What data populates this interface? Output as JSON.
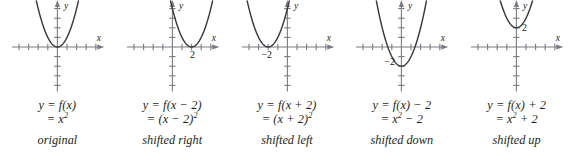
{
  "figure": {
    "axis_color": "#7b7b83",
    "curve_color": "#3a3a3e",
    "text_color": "#231f20",
    "background": "#ffffff"
  },
  "panels": [
    {
      "name": "original",
      "equation_line1": "y = f(x)",
      "equation_line2_prefix": "= x",
      "equation_line2_exp": "2",
      "equation_line2_suffix": "",
      "description": "original",
      "x_axis_label": "x",
      "y_axis_label": "y",
      "vertex_label": "",
      "vertex_x": 0,
      "vertex_y": 0,
      "ticks_left": 4,
      "ticks_right": 4,
      "ticks_up": 4,
      "ticks_down": 4
    },
    {
      "name": "shifted-right",
      "equation_line1": "y = f(x − 2)",
      "equation_line2_prefix": "= (x − 2)",
      "equation_line2_exp": "2",
      "equation_line2_suffix": "",
      "description": "shifted right",
      "x_axis_label": "x",
      "y_axis_label": "y",
      "vertex_label": "2",
      "vertex_x": 2,
      "vertex_y": 0,
      "ticks_left": 4,
      "ticks_right": 4,
      "ticks_up": 4,
      "ticks_down": 4
    },
    {
      "name": "shifted-left",
      "equation_line1": "y = f(x + 2)",
      "equation_line2_prefix": "= (x + 2)",
      "equation_line2_exp": "2",
      "equation_line2_suffix": "",
      "description": "shifted left",
      "x_axis_label": "x",
      "y_axis_label": "y",
      "vertex_label": "−2",
      "vertex_x": -2,
      "vertex_y": 0,
      "ticks_left": 4,
      "ticks_right": 4,
      "ticks_up": 4,
      "ticks_down": 4
    },
    {
      "name": "shifted-down",
      "equation_line1": "y = f(x) − 2",
      "equation_line2_prefix": "= x",
      "equation_line2_exp": "2",
      "equation_line2_suffix": " − 2",
      "description": "shifted down",
      "x_axis_label": "x",
      "y_axis_label": "y",
      "vertex_label": "−2",
      "vertex_x": 0,
      "vertex_y": -2,
      "ticks_left": 4,
      "ticks_right": 4,
      "ticks_up": 4,
      "ticks_down": 4
    },
    {
      "name": "shifted-up",
      "equation_line1": "y = f(x) + 2",
      "equation_line2_prefix": "= x",
      "equation_line2_exp": "2",
      "equation_line2_suffix": " + 2",
      "description": "shifted up",
      "x_axis_label": "x",
      "y_axis_label": "y",
      "vertex_label": "2",
      "vertex_x": 0,
      "vertex_y": 2,
      "ticks_left": 4,
      "ticks_right": 4,
      "ticks_up": 4,
      "ticks_down": 4
    }
  ],
  "chart_data": {
    "type": "line",
    "xlabel": "x",
    "ylabel": "y",
    "xlim": [
      -4.6,
      4.6
    ],
    "ylim": [
      -4.6,
      4.6
    ],
    "grid": false,
    "legend": "none",
    "series": [
      {
        "name": "y = f(x) = x^2",
        "panel": "original",
        "vertex": [
          0,
          0
        ],
        "formula": "y = x^2"
      },
      {
        "name": "y = f(x - 2) = (x - 2)^2",
        "panel": "shifted right",
        "vertex": [
          2,
          0
        ],
        "formula": "y = (x - 2)^2"
      },
      {
        "name": "y = f(x + 2) = (x + 2)^2",
        "panel": "shifted left",
        "vertex": [
          -2,
          0
        ],
        "formula": "y = (x + 2)^2"
      },
      {
        "name": "y = f(x) - 2 = x^2 - 2",
        "panel": "shifted down",
        "vertex": [
          0,
          -2
        ],
        "formula": "y = x^2 - 2"
      },
      {
        "name": "y = f(x) + 2 = x^2 + 2",
        "panel": "shifted up",
        "vertex": [
          0,
          2
        ],
        "formula": "y = x^2 + 2"
      }
    ]
  }
}
